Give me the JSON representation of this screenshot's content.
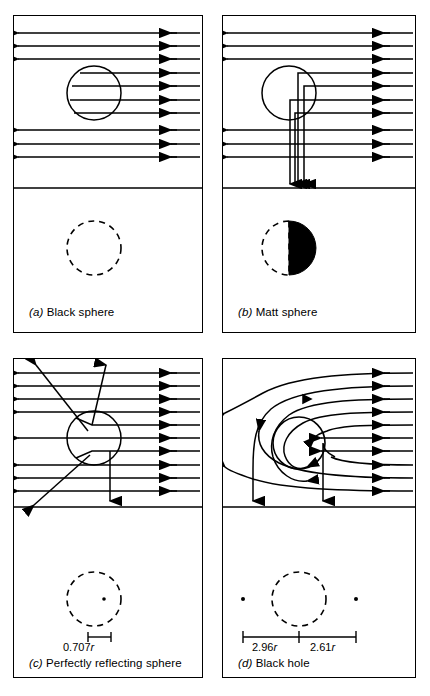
{
  "figure": {
    "type": "physics-diagram",
    "background": "#ffffff",
    "ink": "#000000"
  },
  "panels": [
    {
      "id": "a",
      "letter": "(a)",
      "title": "Black sphere",
      "caption": "(a) Black sphere",
      "ray_direction": "right-to-left",
      "ray_count": 11,
      "behaviour": "absorbed",
      "shadow": {
        "style": "dashed-circle",
        "fill": "none"
      },
      "measurements": []
    },
    {
      "id": "b",
      "letter": "(b)",
      "title": "Matt sphere",
      "caption": "(b) Matt sphere",
      "ray_direction": "right-to-left",
      "ray_count": 11,
      "behaviour": "scattered-downward",
      "shadow": {
        "style": "half-filled-circle",
        "fill": "#000000",
        "filled_side": "right"
      },
      "measurements": []
    },
    {
      "id": "c",
      "letter": "(c)",
      "title": "Perfectly reflecting sphere",
      "caption": "(c) Perfectly reflecting sphere",
      "ray_direction": "right-to-left",
      "ray_count": 11,
      "behaviour": "specular-reflection",
      "shadow": {
        "style": "dashed-circle",
        "fill": "none",
        "centre_dot": true
      },
      "measurements": [
        {
          "label": "0.707r",
          "value": 0.707,
          "unit": "r"
        }
      ]
    },
    {
      "id": "d",
      "letter": "(d)",
      "title": "Black hole",
      "caption": "(d) Black hole",
      "ray_direction": "right-to-left",
      "ray_count": 11,
      "behaviour": "gravitationally-bent",
      "shadow": {
        "style": "dashed-circle",
        "fill": "none",
        "side_dots": 2
      },
      "measurements": [
        {
          "label": "2.96r",
          "value": 2.96,
          "unit": "r"
        },
        {
          "label": "2.61r",
          "value": 2.61,
          "unit": "r"
        }
      ]
    }
  ],
  "labels": {
    "a_caption_letter": "(a)",
    "a_caption_text": " Black sphere",
    "b_caption_letter": "(b)",
    "b_caption_text": " Matt sphere",
    "c_caption_letter": "(c)",
    "c_caption_text": " Perfectly reflecting sphere",
    "d_caption_letter": "(d)",
    "d_caption_text": " Black hole",
    "c_measure": "0.707",
    "c_measure_unit": "r",
    "d_measure_left": "2.96",
    "d_measure_left_unit": "r",
    "d_measure_right": "2.61",
    "d_measure_right_unit": "r"
  }
}
